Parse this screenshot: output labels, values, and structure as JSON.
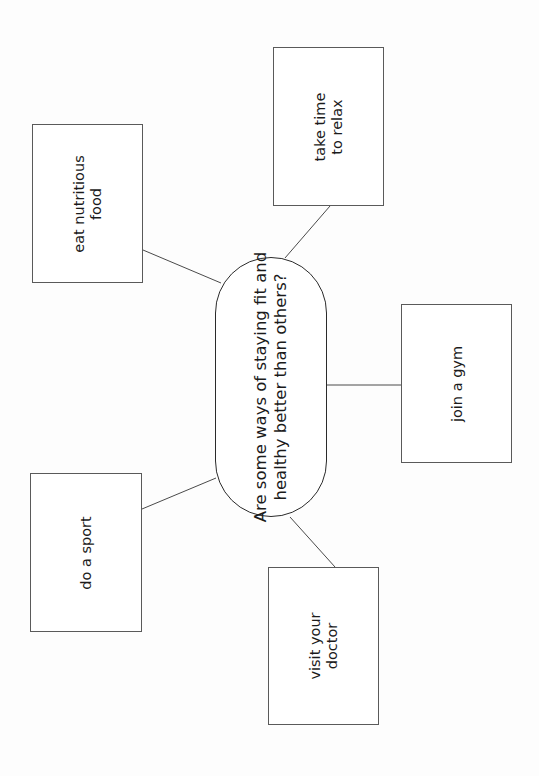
{
  "diagram": {
    "type": "mind-map",
    "orientation": "rotated-90-ccw",
    "center": {
      "lines": [
        "Are some ways of staying fit and",
        "healthy better than others?"
      ]
    },
    "nodes": [
      {
        "id": "eat",
        "lines": [
          "eat nutritious",
          "food"
        ]
      },
      {
        "id": "relax",
        "lines": [
          "take time",
          "to relax"
        ]
      },
      {
        "id": "gym",
        "lines": [
          "join a gym"
        ]
      },
      {
        "id": "sport",
        "lines": [
          "do a sport"
        ]
      },
      {
        "id": "doctor",
        "lines": [
          "visit your",
          "doctor"
        ]
      }
    ],
    "colors": {
      "background": "#fdfdfd",
      "stroke": "#4a4a4a",
      "text": "#1b1b1b"
    }
  }
}
